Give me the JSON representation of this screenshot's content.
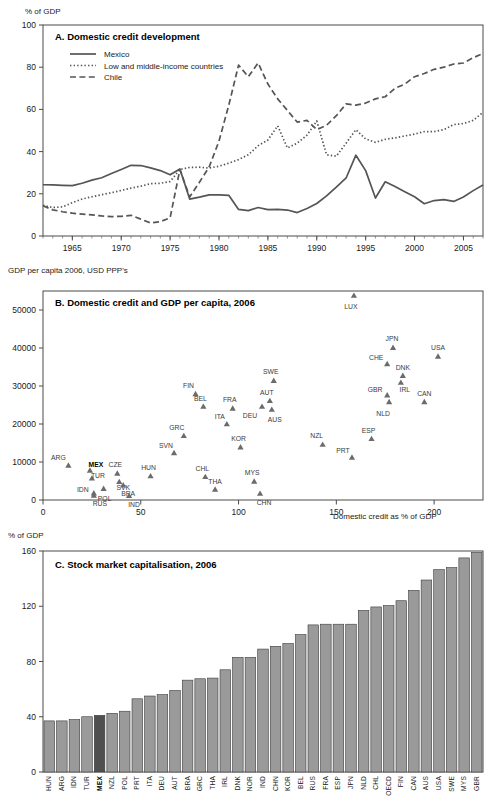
{
  "figure": {
    "panelA": {
      "unit_label": "% of GDP",
      "title": "A. Domestic credit development",
      "legend": [
        {
          "label": "Mexico",
          "style": "solid",
          "color": "#555555"
        },
        {
          "label": "Low and middle-income countries",
          "style": "dotted",
          "color": "#555555"
        },
        {
          "label": "Chile",
          "style": "dashed",
          "color": "#555555"
        }
      ],
      "y_ticks": [
        "0",
        "20",
        "40",
        "60",
        "80",
        "100"
      ],
      "x_ticks": [
        "1965",
        "1970",
        "1975",
        "1980",
        "1985",
        "1990",
        "1995",
        "2000",
        "2005"
      ]
    },
    "panelB": {
      "unit_label": "GDP per capita 2006, USD PPP's",
      "title": "B. Domestic credit and GDP per capita, 2006",
      "x_axis_label": "Domestic credit as % of GDP",
      "y_ticks": [
        "0",
        "10000",
        "20000",
        "30000",
        "40000",
        "50000"
      ],
      "x_ticks": [
        "0",
        "50",
        "100",
        "150",
        "200"
      ]
    },
    "panelC": {
      "unit_label": "% of GDP",
      "title": "C. Stock market capitalisation, 2006",
      "y_ticks": [
        "0",
        "40",
        "80",
        "120",
        "160"
      ],
      "highlight": "MEX",
      "bar_color": "#9a9a9a",
      "highlight_color": "#4f4f4f"
    }
  },
  "chart_data": [
    {
      "type": "line",
      "title": "A. Domestic credit development",
      "xlabel": "",
      "ylabel": "% of GDP",
      "xlim": [
        1962,
        2007
      ],
      "ylim": [
        0,
        100
      ],
      "grid": false,
      "legend_position": "top-left",
      "x": [
        1962,
        1963,
        1964,
        1965,
        1966,
        1967,
        1968,
        1969,
        1970,
        1971,
        1972,
        1973,
        1974,
        1975,
        1976,
        1977,
        1978,
        1979,
        1980,
        1981,
        1982,
        1983,
        1984,
        1985,
        1986,
        1987,
        1988,
        1989,
        1990,
        1991,
        1992,
        1993,
        1994,
        1995,
        1996,
        1997,
        1998,
        1999,
        2000,
        2001,
        2002,
        2003,
        2004,
        2005,
        2006,
        2007
      ],
      "series": [
        {
          "name": "Mexico",
          "style": "solid",
          "values": [
            24.3,
            24.2,
            24.0,
            23.9,
            25.0,
            26.5,
            27.6,
            29.6,
            31.5,
            33.5,
            33.4,
            32.3,
            31.0,
            29.0,
            31.8,
            17.5,
            18.4,
            19.5,
            19.5,
            19.3,
            12.6,
            12.0,
            13.5,
            12.5,
            12.6,
            12.3,
            11.1,
            13.0,
            15.4,
            19.0,
            23.2,
            27.5,
            38.3,
            31.0,
            18.0,
            25.7,
            23.5,
            21.0,
            18.6,
            15.3,
            16.8,
            17.2,
            16.4,
            18.5,
            21.5,
            24.2
          ]
        },
        {
          "name": "Low and middle-income countries",
          "style": "dotted",
          "values": [
            14.5,
            13.5,
            13.8,
            15.8,
            17.5,
            18.6,
            19.6,
            20.5,
            21.6,
            22.7,
            23.6,
            24.8,
            25.0,
            25.8,
            31.5,
            32.5,
            32.6,
            32.2,
            33.1,
            34.5,
            36.2,
            38.5,
            42.8,
            45.5,
            52.2,
            41.7,
            44.0,
            47.8,
            54.5,
            38.5,
            37.8,
            44.0,
            50.4,
            46.0,
            44.4,
            45.8,
            46.5,
            47.4,
            48.3,
            49.5,
            49.5,
            50.4,
            52.8,
            53.3,
            54.8,
            58.6
          ]
        },
        {
          "name": "Chile",
          "style": "dashed",
          "values": [
            14.3,
            12.4,
            11.5,
            10.8,
            10.4,
            10.0,
            9.5,
            9.2,
            9.3,
            9.8,
            8.0,
            6.2,
            6.8,
            8.6,
            31.5,
            18.5,
            25.5,
            32.8,
            45.0,
            62.0,
            81.0,
            75.5,
            82.0,
            72.0,
            65.0,
            59.5,
            54.0,
            54.8,
            50.4,
            52.5,
            57.0,
            62.6,
            62.0,
            63.0,
            65.0,
            66.0,
            70.0,
            72.0,
            75.5,
            77.0,
            79.0,
            80.0,
            81.5,
            82.0,
            84.5,
            86.5
          ]
        }
      ]
    },
    {
      "type": "scatter",
      "title": "B. Domestic credit and GDP per capita, 2006",
      "xlabel": "Domestic credit as % of GDP",
      "ylabel": "GDP per capita 2006, USD PPP's",
      "xlim": [
        0,
        225
      ],
      "ylim": [
        0,
        55000
      ],
      "grid": false,
      "marker": "triangle",
      "marker_color": "#6b6b6b",
      "points": [
        {
          "code": "ARG",
          "x": 13,
          "y": 8500,
          "lx": -10,
          "ly": -6,
          "bold": false
        },
        {
          "code": "MEX",
          "x": 24,
          "y": 7200,
          "lx": 6,
          "ly": -4,
          "bold": true
        },
        {
          "code": "TUR",
          "x": 25,
          "y": 5100,
          "lx": 6,
          "ly": -1,
          "bold": false
        },
        {
          "code": "IDN",
          "x": 26,
          "y": 1200,
          "lx": -11,
          "ly": -2,
          "bold": false
        },
        {
          "code": "RUS",
          "x": 26,
          "y": 600,
          "lx": 6,
          "ly": 3,
          "bold": false
        },
        {
          "code": "POL",
          "x": 31,
          "y": 2400,
          "lx": 1,
          "ly": 5,
          "bold": false
        },
        {
          "code": "CZE",
          "x": 38,
          "y": 6400,
          "lx": -2,
          "ly": -7,
          "bold": false
        },
        {
          "code": "SVK",
          "x": 39,
          "y": 4200,
          "lx": 4,
          "ly": 0,
          "bold": false
        },
        {
          "code": "BRA",
          "x": 41,
          "y": 3300,
          "lx": 5,
          "ly": 3,
          "bold": false
        },
        {
          "code": "IND",
          "x": 44,
          "y": 500,
          "lx": 5,
          "ly": 3,
          "bold": false
        },
        {
          "code": "HUN",
          "x": 55,
          "y": 5700,
          "lx": -2,
          "ly": -7,
          "bold": false
        },
        {
          "code": "SVN",
          "x": 67,
          "y": 11800,
          "lx": -8,
          "ly": -6,
          "bold": false
        },
        {
          "code": "GRC",
          "x": 72,
          "y": 16300,
          "lx": -7,
          "ly": -7,
          "bold": false
        },
        {
          "code": "FIN",
          "x": 78,
          "y": 27300,
          "lx": -7,
          "ly": -7,
          "bold": false
        },
        {
          "code": "BEL",
          "x": 82,
          "y": 24000,
          "lx": -3,
          "ly": -6,
          "bold": false
        },
        {
          "code": "CHL",
          "x": 83,
          "y": 5500,
          "lx": -3,
          "ly": -7,
          "bold": false
        },
        {
          "code": "THA",
          "x": 88,
          "y": 2200,
          "lx": 0,
          "ly": -6,
          "bold": false
        },
        {
          "code": "ITA",
          "x": 94,
          "y": 19400,
          "lx": -7,
          "ly": -6,
          "bold": false
        },
        {
          "code": "FRA",
          "x": 97,
          "y": 23500,
          "lx": -3,
          "ly": -7,
          "bold": false
        },
        {
          "code": "KOR",
          "x": 101,
          "y": 13300,
          "lx": -2,
          "ly": -7,
          "bold": false
        },
        {
          "code": "MYS",
          "x": 108,
          "y": 4300,
          "lx": -2,
          "ly": -7,
          "bold": false
        },
        {
          "code": "CHN",
          "x": 111,
          "y": 1100,
          "lx": 4,
          "ly": 4,
          "bold": false
        },
        {
          "code": "DEU",
          "x": 112,
          "y": 24000,
          "lx": -12,
          "ly": 4,
          "bold": false
        },
        {
          "code": "AUT",
          "x": 116,
          "y": 25500,
          "lx": -3,
          "ly": -7,
          "bold": false
        },
        {
          "code": "AUS",
          "x": 117,
          "y": 23200,
          "lx": 3,
          "ly": 5,
          "bold": false
        },
        {
          "code": "SWE",
          "x": 118,
          "y": 30800,
          "lx": -3,
          "ly": -7,
          "bold": false
        },
        {
          "code": "NZL",
          "x": 143,
          "y": 14000,
          "lx": -6,
          "ly": -7,
          "bold": false
        },
        {
          "code": "LUX",
          "x": 159,
          "y": 53200,
          "lx": -3,
          "ly": 6,
          "bold": false
        },
        {
          "code": "PRT",
          "x": 158,
          "y": 10600,
          "lx": -9,
          "ly": -5,
          "bold": false
        },
        {
          "code": "ESP",
          "x": 168,
          "y": 15500,
          "lx": -3,
          "ly": -7,
          "bold": false
        },
        {
          "code": "CHE",
          "x": 176,
          "y": 35200,
          "lx": -11,
          "ly": -5,
          "bold": false
        },
        {
          "code": "GBR",
          "x": 176,
          "y": 27000,
          "lx": -12,
          "ly": -4,
          "bold": false
        },
        {
          "code": "NLD",
          "x": 177,
          "y": 25200,
          "lx": -6,
          "ly": 6,
          "bold": false
        },
        {
          "code": "JPN",
          "x": 179,
          "y": 39500,
          "lx": -1,
          "ly": -7,
          "bold": false
        },
        {
          "code": "IRL",
          "x": 183,
          "y": 30300,
          "lx": 4,
          "ly": 2,
          "bold": false
        },
        {
          "code": "DNK",
          "x": 184,
          "y": 32100,
          "lx": 0,
          "ly": -7,
          "bold": false
        },
        {
          "code": "CAN",
          "x": 195,
          "y": 25200,
          "lx": 0,
          "ly": -7,
          "bold": false
        },
        {
          "code": "USA",
          "x": 202,
          "y": 37200,
          "lx": 0,
          "ly": -7,
          "bold": false
        }
      ]
    },
    {
      "type": "bar",
      "title": "C. Stock market capitalisation, 2006",
      "xlabel": "",
      "ylabel": "% of GDP",
      "ylim": [
        0,
        160
      ],
      "grid": false,
      "highlight_category": "MEX",
      "categories": [
        "HUN",
        "ARG",
        "IDN",
        "TUR",
        "MEX",
        "NZL",
        "POL",
        "PRT",
        "ITA",
        "DEU",
        "AUT",
        "BRA",
        "GRC",
        "THA",
        "IRL",
        "DNK",
        "NOR",
        "IND",
        "CHN",
        "KOR",
        "BEL",
        "RUS",
        "FRA",
        "ESP",
        "JPN",
        "NLD",
        "CHL",
        "OECD",
        "FIN",
        "CAN",
        "AUS",
        "USA",
        "SWE",
        "MYS",
        "GBR"
      ],
      "values": [
        37,
        37,
        38,
        40,
        41,
        42.5,
        44,
        53,
        55,
        56,
        59,
        66.5,
        67.5,
        68,
        74,
        83,
        83,
        89,
        91,
        93,
        99.5,
        106.5,
        107,
        107,
        107,
        117,
        119.5,
        120.5,
        124,
        131.5,
        139,
        146.5,
        148,
        155,
        159
      ]
    }
  ]
}
